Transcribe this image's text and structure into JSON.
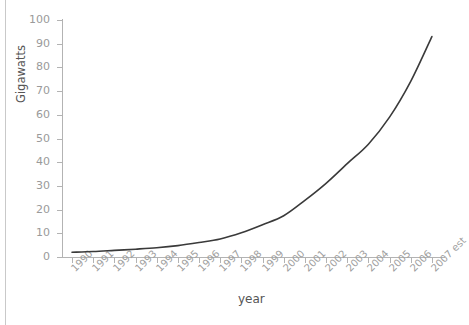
{
  "chart_data": {
    "type": "line",
    "title": "",
    "xlabel": "year",
    "ylabel": "Gigawatts",
    "ylim": [
      0,
      100
    ],
    "ytick_values": [
      0,
      10,
      20,
      30,
      40,
      50,
      60,
      70,
      80,
      90,
      100
    ],
    "grid": false,
    "legend": null,
    "categories": [
      "1990",
      "1991",
      "1992",
      "1993",
      "1994",
      "1995",
      "1996",
      "1997",
      "1998",
      "1999",
      "2000",
      "2001",
      "2002",
      "2003",
      "2004",
      "2005",
      "2006",
      "2007 est"
    ],
    "x": [
      "1990",
      "1991",
      "1992",
      "1993",
      "1994",
      "1995",
      "1996",
      "1997",
      "1998",
      "1999",
      "2000",
      "2001",
      "2002",
      "2003",
      "2004",
      "2005",
      "2006",
      "2007 est"
    ],
    "values": [
      2,
      2.3,
      2.8,
      3.3,
      3.9,
      4.8,
      6.1,
      7.6,
      10.2,
      13.6,
      17.4,
      23.9,
      31.1,
      39.4,
      47.6,
      59.0,
      74.1,
      93.0
    ],
    "series": [
      {
        "name": "Installed capacity",
        "color": "#3a3a3a",
        "values": [
          2,
          2.3,
          2.8,
          3.3,
          3.9,
          4.8,
          6.1,
          7.6,
          10.2,
          13.6,
          17.4,
          23.9,
          31.1,
          39.4,
          47.6,
          59.0,
          74.1,
          93.0
        ]
      }
    ]
  },
  "axes": {
    "y_title": "Gigawatts",
    "x_title": "year",
    "y_ticks": [
      "0",
      "10",
      "20",
      "30",
      "40",
      "50",
      "60",
      "70",
      "80",
      "90",
      "100"
    ],
    "x_ticks": [
      "1990",
      "1991",
      "1992",
      "1993",
      "1994",
      "1995",
      "1996",
      "1997",
      "1998",
      "1999",
      "2000",
      "2001",
      "2002",
      "2003",
      "2004",
      "2005",
      "2006",
      "2007 est"
    ]
  },
  "colors": {
    "line": "#3a3a3a",
    "axis": "#b3b3b3",
    "tick_text": "#9a9a9a",
    "title_text": "#555555",
    "background": "#ffffff",
    "border_rule": "#c9c9c9"
  }
}
